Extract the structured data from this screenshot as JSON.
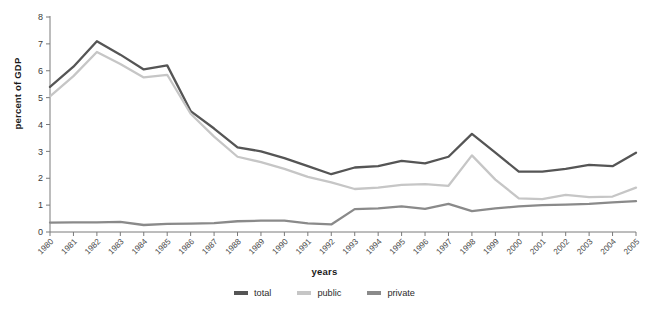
{
  "chart_data": {
    "type": "line",
    "title": "",
    "xlabel": "years",
    "ylabel": "percent of GDP",
    "ylim": [
      0,
      8
    ],
    "yticks": [
      0,
      1,
      2,
      3,
      4,
      5,
      6,
      7,
      8
    ],
    "grid": false,
    "legend_position": "bottom",
    "categories": [
      "1980",
      "1981",
      "1982",
      "1983",
      "1984",
      "1985",
      "1986",
      "1987",
      "1988",
      "1989",
      "1990",
      "1991",
      "1992",
      "1993",
      "1994",
      "1995",
      "1996",
      "1997",
      "1998",
      "1999",
      "2000",
      "2001",
      "2002",
      "2003",
      "2004",
      "2005"
    ],
    "series": [
      {
        "name": "total",
        "color": "#555555",
        "values": [
          5.4,
          6.15,
          7.1,
          6.6,
          6.05,
          6.2,
          4.5,
          3.85,
          3.15,
          3.0,
          2.75,
          2.45,
          2.15,
          2.4,
          2.45,
          2.65,
          2.55,
          2.8,
          3.65,
          2.95,
          2.25,
          2.25,
          2.35,
          2.5,
          2.45,
          2.95
        ]
      },
      {
        "name": "public",
        "color": "#c6c6c6",
        "values": [
          5.05,
          5.8,
          6.7,
          6.25,
          5.75,
          5.85,
          4.4,
          3.55,
          2.8,
          2.6,
          2.35,
          2.05,
          1.85,
          1.6,
          1.65,
          1.75,
          1.78,
          1.72,
          2.85,
          1.95,
          1.25,
          1.22,
          1.38,
          1.3,
          1.32,
          1.65
        ]
      },
      {
        "name": "private",
        "color": "#8a8a8a",
        "values": [
          0.35,
          0.36,
          0.36,
          0.38,
          0.26,
          0.3,
          0.31,
          0.33,
          0.4,
          0.42,
          0.42,
          0.32,
          0.28,
          0.85,
          0.88,
          0.95,
          0.86,
          1.05,
          0.78,
          0.88,
          0.95,
          1.0,
          1.02,
          1.05,
          1.1,
          1.15
        ]
      }
    ]
  },
  "legend": {
    "items": [
      {
        "label": "total",
        "color": "#555555"
      },
      {
        "label": "public",
        "color": "#c6c6c6"
      },
      {
        "label": "private",
        "color": "#8a8a8a"
      }
    ]
  },
  "axes": {
    "y_title": "percent of GDP",
    "x_title": "years"
  }
}
